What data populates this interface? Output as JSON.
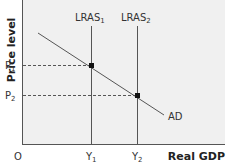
{
  "diagram": {
    "title": "",
    "type": "economics-ad-lras",
    "axes": {
      "y_label": "Price level",
      "x_label": "Real GDP",
      "origin_label": "O"
    },
    "price_levels": [
      {
        "id": "p1",
        "label": "P",
        "sub": "1"
      },
      {
        "id": "p2",
        "label": "P",
        "sub": "2"
      }
    ],
    "output_levels": [
      {
        "id": "y1",
        "label": "Y",
        "sub": "1"
      },
      {
        "id": "y2",
        "label": "Y",
        "sub": "2"
      }
    ],
    "curves": [
      {
        "id": "lras1",
        "label": "LRAS",
        "sub": "1",
        "kind": "vertical"
      },
      {
        "id": "lras2",
        "label": "LRAS",
        "sub": "2",
        "kind": "vertical"
      },
      {
        "id": "ad",
        "label": "AD",
        "kind": "downward-sloping"
      }
    ],
    "equilibria": [
      {
        "id": "e1",
        "at": [
          "y1",
          "p1"
        ]
      },
      {
        "id": "e2",
        "at": [
          "y2",
          "p2"
        ]
      }
    ],
    "colors": {
      "plot_bg": "#f0f0f0",
      "line": "#555555",
      "dashed": "#555555",
      "point": "#111111",
      "text": "#333333"
    }
  }
}
